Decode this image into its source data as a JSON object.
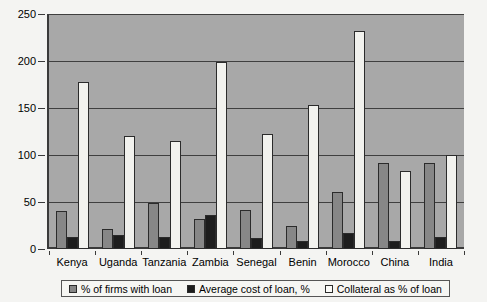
{
  "chart_data": {
    "type": "bar",
    "title": "",
    "subtitle": "",
    "xlabel": "",
    "ylabel": "",
    "ylim": [
      0,
      250
    ],
    "yticks": [
      0,
      50,
      100,
      150,
      200,
      250
    ],
    "grid": true,
    "legend_position": "bottom",
    "categories": [
      "Kenya",
      "Uganda",
      "Tanzania",
      "Zambia",
      "Senegal",
      "Benin",
      "Morocco",
      "China",
      "India"
    ],
    "series": [
      {
        "name": "% of firms with loan",
        "color": "#878787",
        "values": [
          40,
          21,
          49,
          32,
          41,
          25,
          61,
          91,
          92
        ]
      },
      {
        "name": "Average cost of loan, %",
        "color": "#1d1d1d",
        "values": [
          13,
          15,
          13,
          36,
          12,
          9,
          17,
          8,
          13
        ]
      },
      {
        "name": "Collateral as % of loan",
        "color": "#f2f2ee",
        "values": [
          178,
          120,
          115,
          199,
          122,
          153,
          232,
          83,
          100
        ]
      }
    ]
  },
  "legend": {
    "items": [
      {
        "label": "% of firms with loan",
        "swatch": "legend-swatch-series-0"
      },
      {
        "label": "Average cost of loan, %",
        "swatch": "legend-swatch-series-1"
      },
      {
        "label": "Collateral as % of loan",
        "swatch": "legend-swatch-series-2"
      }
    ]
  },
  "colors": {
    "plot_background": "#a8a8a8",
    "page_background": "#f4f4f2",
    "axis": "#3a3a3a",
    "gridline": "#3f3f3f"
  }
}
